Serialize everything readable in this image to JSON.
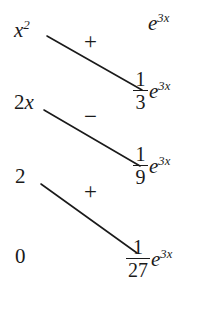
{
  "document": {
    "title": "Tabular Integration by Parts",
    "background_color": "#ffffff",
    "ink_color": "#1a1a1a"
  },
  "chart_data": {
    "type": "table",
    "columns": [
      "derivatives",
      "signs",
      "integrals"
    ],
    "rows": [
      {
        "derivative": "x^2",
        "sign": "+",
        "integral": "e^{3x}"
      },
      {
        "derivative": "2x",
        "sign": "-",
        "integral": "(1/3)e^{3x}"
      },
      {
        "derivative": "2",
        "sign": "+",
        "integral": "(1/9)e^{3x}"
      },
      {
        "derivative": "0",
        "sign": "",
        "integral": "(1/27)e^{3x}"
      }
    ]
  },
  "derivative_column": [
    {
      "base": "x",
      "exponent": "2",
      "coefficient": "",
      "plain": "x"
    },
    {
      "base": "x",
      "exponent": "",
      "coefficient": "2",
      "plain": "2x"
    },
    {
      "base": "",
      "exponent": "",
      "coefficient": "2",
      "plain": "2"
    },
    {
      "base": "",
      "exponent": "",
      "coefficient": "0",
      "plain": "0"
    }
  ],
  "signs": [
    {
      "label": "+",
      "name": "plus"
    },
    {
      "label": "−",
      "name": "minus"
    },
    {
      "label": "+",
      "name": "plus"
    }
  ],
  "integral_column": [
    {
      "has_fraction": false,
      "numerator": "",
      "denominator": "",
      "base": "e",
      "exponent": "3x"
    },
    {
      "has_fraction": true,
      "numerator": "1",
      "denominator": "3",
      "base": "e",
      "exponent": "3x"
    },
    {
      "has_fraction": true,
      "numerator": "1",
      "denominator": "9",
      "base": "e",
      "exponent": "3x"
    },
    {
      "has_fraction": true,
      "numerator": "1",
      "denominator": "27",
      "base": "e",
      "exponent": "3x"
    }
  ],
  "connector_lines": [
    {
      "from_row": 0,
      "to_row": 1,
      "x1": 47,
      "y1": 36,
      "x2": 142,
      "y2": 90
    },
    {
      "from_row": 1,
      "to_row": 2,
      "x1": 44,
      "y1": 110,
      "x2": 140,
      "y2": 166
    },
    {
      "from_row": 2,
      "to_row": 3,
      "x1": 41,
      "y1": 184,
      "x2": 137,
      "y2": 253
    }
  ]
}
